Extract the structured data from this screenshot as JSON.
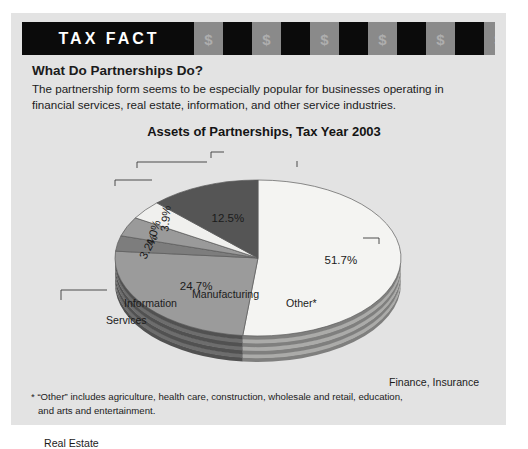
{
  "banner": {
    "title": "TAX FACT",
    "dollar_symbol": "$",
    "blocks": [
      "gray",
      "dark",
      "gray",
      "dark",
      "gray",
      "dark",
      "gray",
      "dark",
      "gray",
      "dark",
      "gray"
    ],
    "colors": {
      "dark": "#0b0b0b",
      "gray": "#8a8a8a",
      "symbol": "#aeaeae"
    }
  },
  "headline": "What Do Partnerships Do?",
  "intro_line1": "The partnership form seems to be especially popular for businesses operating in",
  "intro_line2": "financial services, real estate, information, and other service industries.",
  "footnote_line1": "* “Other” includes agriculture, health care, construction, wholesale and retail, education,",
  "footnote_line2": "and arts and entertainment.",
  "chart_data": {
    "type": "pie",
    "title": "Assets of Partnerships, Tax Year 2003",
    "xlabel": "",
    "ylabel": "",
    "legend": "callout-labels",
    "three_d": true,
    "grid": false,
    "units": "percent",
    "categories": [
      "Finance, Insurance",
      "Real Estate",
      "Services",
      "Information",
      "Manufacturing",
      "Other*"
    ],
    "values": [
      51.7,
      24.7,
      3.2,
      4.0,
      3.9,
      12.5
    ],
    "labels": [
      "51.7%",
      "24.7%",
      "3.2%",
      "4.0%",
      "3.9%",
      "12.5%"
    ],
    "slice_colors": [
      "#f4f4f2",
      "#9b9b9b",
      "#7d7d7d",
      "#9a9a9a",
      "#f0f0ee",
      "#555555"
    ],
    "slices": [
      {
        "name": "Finance, Insurance",
        "value": 51.7,
        "label": "51.7%",
        "color": "#f4f4f2"
      },
      {
        "name": "Real Estate",
        "value": 24.7,
        "label": "24.7%",
        "color": "#9b9b9b"
      },
      {
        "name": "Services",
        "value": 3.2,
        "label": "3.2%",
        "color": "#7d7d7d"
      },
      {
        "name": "Information",
        "value": 4.0,
        "label": "4.0%",
        "color": "#9a9a9a"
      },
      {
        "name": "Manufacturing",
        "value": 3.9,
        "label": "3.9%",
        "color": "#f0f0ee"
      },
      {
        "name": "Other*",
        "value": 12.5,
        "label": "12.5%",
        "color": "#555555"
      }
    ]
  },
  "callouts": {
    "services": "Services",
    "information": "Information",
    "manufacturing": "Manufacturing",
    "other": "Other*",
    "finance": "Finance, Insurance",
    "real_estate": "Real Estate"
  }
}
